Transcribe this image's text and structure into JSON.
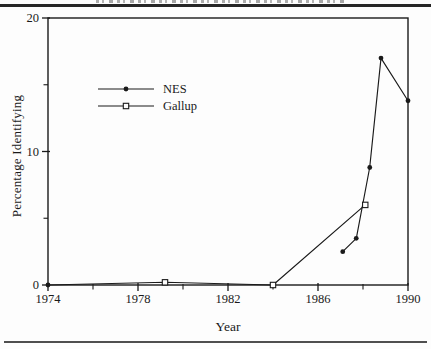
{
  "figure": {
    "background": "#fdfdfd",
    "top_rule_color": "#262626",
    "bottom_rule_color": "#4f4f4f",
    "ink_color": "#1a1a1a"
  },
  "chart_data": {
    "type": "line",
    "title": "",
    "xlabel": "Year",
    "ylabel": "Percentage Identifying",
    "xlim": [
      1974,
      1990
    ],
    "ylim": [
      0,
      20
    ],
    "x_major_ticks": [
      1974,
      1978,
      1982,
      1986,
      1990
    ],
    "x_minor_ticks": [
      1976,
      1980,
      1984,
      1988
    ],
    "y_major_ticks": [
      0,
      10,
      20
    ],
    "y_minor_ticks": [
      5,
      15
    ],
    "grid": false,
    "legend_position": "upper-left-inside",
    "series": [
      {
        "name": "NES",
        "color": "#1a1a1a",
        "marker": "filled-circle",
        "points": [
          {
            "x": 1974,
            "y": 0,
            "gap": true
          },
          {
            "x": 1987.1,
            "y": 2.5,
            "gap": true
          },
          {
            "x": 1987.7,
            "y": 3.5
          },
          {
            "x": 1988.3,
            "y": 8.8
          },
          {
            "x": 1988.8,
            "y": 17
          },
          {
            "x": 1990,
            "y": 13.8
          }
        ]
      },
      {
        "name": "Gallup",
        "color": "#1a1a1a",
        "marker": "open-square",
        "points": [
          {
            "x": 1974,
            "y": 0,
            "marker": false
          },
          {
            "x": 1979.2,
            "y": 0.2
          },
          {
            "x": 1984,
            "y": 0
          },
          {
            "x": 1988.1,
            "y": 6
          }
        ]
      }
    ]
  }
}
